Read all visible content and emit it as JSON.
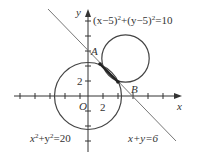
{
  "diagram": {
    "axes": {
      "x_label": "x",
      "y_label": "y",
      "origin_label": "O",
      "x_tick_label": "2",
      "y_tick_label": "2"
    },
    "points": [
      {
        "label": "A",
        "coords": [
          0,
          6
        ]
      },
      {
        "label": "B",
        "coords": [
          6,
          0
        ]
      }
    ],
    "curves": [
      {
        "name": "circle-1",
        "equation": "x²+y²=20",
        "center": [
          0,
          0
        ],
        "radius_sq": 20
      },
      {
        "name": "circle-2",
        "equation": "(x−5)²+(y−5)²=10",
        "center": [
          5,
          5
        ],
        "radius_sq": 10
      },
      {
        "name": "line",
        "equation": "x+y=6"
      }
    ],
    "labels": {
      "circle1_eq": {
        "base": "x",
        "sup1": "2",
        "mid": "+y",
        "sup2": "2",
        "tail": "=20"
      },
      "circle2_eq": {
        "p1": "(x−5)",
        "sup1": "2",
        "mid": "+(y−5)",
        "sup2": "2",
        "tail": "=10"
      },
      "line_eq": "x+y=6"
    },
    "colors": {
      "axis": "#333333",
      "circle": "#444444",
      "line": "#777777"
    }
  }
}
